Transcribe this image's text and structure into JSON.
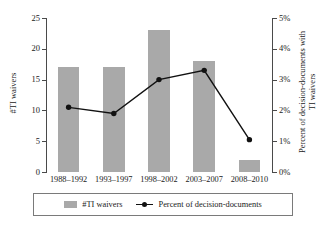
{
  "chart_data": {
    "type": "bar",
    "title": "",
    "xlabel": "",
    "categories": [
      "1988–1992",
      "1993–1997",
      "1998–2002",
      "2003–2007",
      "2008–2010"
    ],
    "series": [
      {
        "name": "#TI waivers",
        "type": "bar",
        "axis": "left",
        "color": "#a9a9a9",
        "values": [
          17,
          17,
          23,
          18,
          2
        ]
      },
      {
        "name": "Percent of decision-documents",
        "type": "line",
        "axis": "right",
        "color": "#111111",
        "marker": "circle",
        "values": [
          2.1,
          1.9,
          3.0,
          3.3,
          1.05
        ]
      }
    ],
    "left_axis": {
      "label": "#TI waivers",
      "ylim": [
        0,
        25
      ],
      "ticks": [
        0,
        5,
        10,
        15,
        20,
        25
      ],
      "ticklabels": [
        "0",
        "5",
        "10",
        "15",
        "20",
        "25"
      ]
    },
    "right_axis": {
      "label_line1": "Percent of decision-documents with",
      "label_line2": "TI waivers",
      "ylim": [
        0,
        5
      ],
      "ticks": [
        0,
        1,
        2,
        3,
        4,
        5
      ],
      "ticklabels": [
        "0%",
        "1%",
        "2%",
        "3%",
        "4%",
        "5%"
      ]
    },
    "grid": false,
    "legend_position": "bottom"
  },
  "legend": {
    "entries": [
      {
        "label": "#TI waivers",
        "icon": "bar-swatch"
      },
      {
        "label": "Percent of decision-documents",
        "icon": "line-marker-swatch"
      }
    ]
  },
  "title_fragment": ""
}
